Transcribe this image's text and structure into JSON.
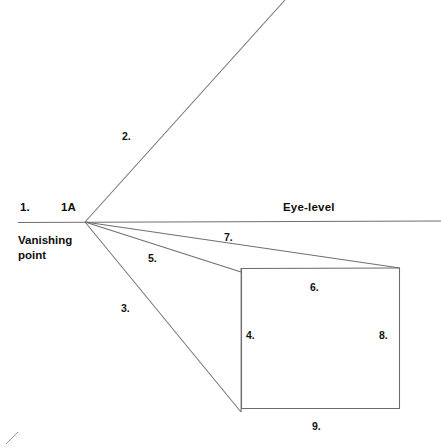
{
  "diagram": {
    "title_text_visible": false,
    "horizon": {
      "eye_level_label": "Eye-level",
      "vanishing_point_label": "Vanishing\npoint",
      "vanishing_point_label_line1": "Vanishing",
      "vanishing_point_label_line2": "point"
    },
    "labels": [
      {
        "id": "label-1",
        "text": "1.",
        "x": 20,
        "y": 200
      },
      {
        "id": "label-1a",
        "text": "1A",
        "x": 61,
        "y": 200
      },
      {
        "id": "label-2",
        "text": "2.",
        "x": 122,
        "y": 130
      },
      {
        "id": "label-3",
        "text": "3.",
        "x": 121,
        "y": 302
      },
      {
        "id": "label-4",
        "text": "4.",
        "x": 246,
        "y": 329
      },
      {
        "id": "label-5",
        "text": "5.",
        "x": 148,
        "y": 252
      },
      {
        "id": "label-6",
        "text": "6.",
        "x": 310,
        "y": 281
      },
      {
        "id": "label-7",
        "text": "7.",
        "x": 224,
        "y": 231
      },
      {
        "id": "label-8",
        "text": "8.",
        "x": 379,
        "y": 329
      },
      {
        "id": "label-9",
        "text": "9.",
        "x": 312,
        "y": 420
      }
    ],
    "colors": {
      "ink": "#100e0c",
      "line": "#6b6b6b",
      "line_dark": "#58585a",
      "background": "#ffffff"
    },
    "geometry": {
      "vanishing_point": {
        "x": 85,
        "y": 222
      },
      "horizon_line": {
        "x1": 18,
        "y1": 222.5,
        "x2": 441,
        "y2": 221
      },
      "ray_2_end": {
        "x": 285,
        "y": 0
      },
      "ray_3_end": {
        "x": 241,
        "y": 412
      },
      "ray_5_end": {
        "x": 241,
        "y": 272
      },
      "ray_7_end": {
        "x": 400,
        "y": 268
      },
      "ray_extra_end": {
        "x": 400,
        "y": 268
      },
      "front_face": {
        "left": 241,
        "top": 268,
        "right": 400,
        "bottom": 409
      },
      "back_face": {
        "left": 241,
        "top": 272,
        "right": 400,
        "bottom": 412
      },
      "corner_mark": {
        "x1": 6,
        "y1": 444,
        "x2": 18,
        "y2": 432
      }
    }
  }
}
